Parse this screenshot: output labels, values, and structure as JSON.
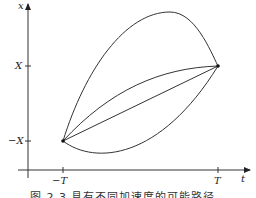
{
  "figure": {
    "axes": {
      "x_label": "t",
      "y_label": "x",
      "x_ticks": [
        "−T",
        "T"
      ],
      "y_ticks": [
        "X",
        "−X"
      ]
    },
    "points": {
      "start": {
        "t": "−T",
        "x": "−X"
      },
      "end": {
        "t": "T",
        "x": "X"
      }
    },
    "paths": [
      {
        "name": "upper-arc",
        "description": "path bulging far above the straight line"
      },
      {
        "name": "upper-slight-curve",
        "description": "path slightly above the straight line"
      },
      {
        "name": "straight-line",
        "description": "constant-velocity straight path"
      },
      {
        "name": "lower-arc",
        "description": "path dipping below the start level"
      }
    ],
    "caption": "图 2.3  具有不同加速度的可能路径"
  },
  "colors": {
    "stroke": "#333333",
    "background": "#ffffff"
  }
}
